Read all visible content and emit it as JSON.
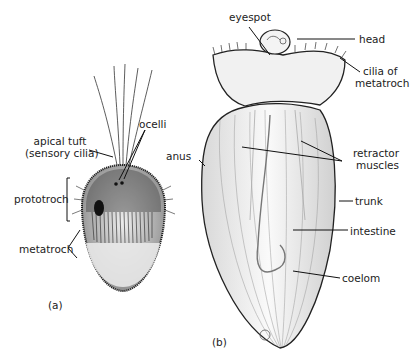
{
  "figure": {
    "panel_a": {
      "caption": "(a)",
      "labels": {
        "apical_tuft_line1": "apical tuft",
        "apical_tuft_line2": "(sensory cilia)",
        "ocelli": "ocelli",
        "prototroch": "prototroch",
        "metatroch": "metatroch"
      }
    },
    "panel_b": {
      "caption": "(b)",
      "labels": {
        "eyespot": "eyespot",
        "head": "head",
        "cilia_line1": "cilia of",
        "cilia_line2": "metatroch",
        "anus": "anus",
        "retractor_line1": "retractor",
        "retractor_line2": "muscles",
        "trunk": "trunk",
        "intestine": "intestine",
        "coelom": "coelom"
      }
    }
  }
}
